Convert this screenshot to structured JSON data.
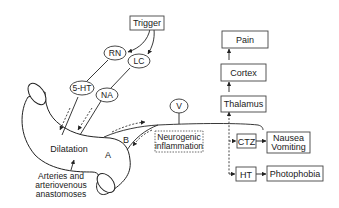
{
  "diagram": {
    "type": "migraine-pathophysiology",
    "nodes": {
      "trigger": "Trigger",
      "rn": "RN",
      "lc": "LC",
      "ht5": "5-HT",
      "na": "NA",
      "v": "V",
      "dilatation": "Dilatation",
      "label_a": "A",
      "label_b": "B",
      "vessel_caption_1": "Arteries and",
      "vessel_caption_2": "arteriovenous",
      "vessel_caption_3": "anastomoses",
      "neuro_1": "Neurogenic",
      "neuro_2": "inflammation",
      "thalamus": "Thalamus",
      "cortex": "Cortex",
      "pain": "Pain",
      "ctz": "CTZ",
      "nausea_1": "Nausea",
      "nausea_2": "Vomiting",
      "ht": "HT",
      "photophobia": "Photophobia"
    },
    "edges": [
      {
        "from": "Trigger",
        "to": "RN",
        "style": "solid-arrow"
      },
      {
        "from": "Trigger",
        "to": "LC",
        "style": "solid-arrow"
      },
      {
        "from": "RN",
        "to": "5-HT",
        "style": "solid"
      },
      {
        "from": "LC",
        "to": "NA",
        "style": "solid"
      },
      {
        "from": "5-HT",
        "to": "Dilatation",
        "style": "dashed-arrow"
      },
      {
        "from": "NA",
        "to": "Dilatation",
        "style": "dashed-arrow"
      },
      {
        "from": "A",
        "to": "V",
        "style": "dashed-arrow"
      },
      {
        "from": "V",
        "to": "B",
        "style": "dashed-arrow"
      },
      {
        "from": "V",
        "to": "Thalamus",
        "style": "dashed-arrow"
      },
      {
        "from": "V",
        "to": "CTZ",
        "style": "dashed-arrow"
      },
      {
        "from": "V",
        "to": "HT",
        "style": "dashed-arrow"
      },
      {
        "from": "Thalamus",
        "to": "Cortex",
        "style": "solid-arrow"
      },
      {
        "from": "Cortex",
        "to": "Pain",
        "style": "solid-arrow"
      },
      {
        "from": "CTZ",
        "to": "Nausea Vomiting",
        "style": "solid-arrow"
      },
      {
        "from": "HT",
        "to": "Photophobia",
        "style": "solid-arrow"
      }
    ]
  }
}
